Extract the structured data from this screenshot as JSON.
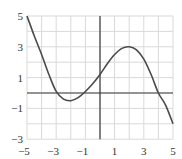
{
  "chart_data": {
    "type": "line",
    "title": "",
    "xlabel": "",
    "ylabel": "",
    "xlim": [
      -5,
      5
    ],
    "ylim": [
      -3,
      5
    ],
    "grid": true,
    "x_ticks": [
      -5,
      -3,
      -1,
      1,
      3,
      5
    ],
    "y_ticks": [
      5,
      3,
      1,
      -1,
      -3
    ],
    "x_tick_labels": [
      "−5",
      "−3",
      "−1",
      "1",
      "3",
      "5"
    ],
    "y_tick_labels": [
      "5",
      "3",
      "1",
      "−1",
      "−3"
    ],
    "series": [
      {
        "name": "f(x)",
        "x": [
          -5,
          -4.5,
          -4,
          -3.5,
          -3,
          -2.5,
          -2,
          -1.5,
          -1,
          -0.5,
          0,
          0.5,
          1,
          1.5,
          2,
          2.5,
          3,
          3.5,
          4,
          4.5,
          5
        ],
        "y": [
          5,
          3.7,
          2.5,
          1.2,
          0.1,
          -0.4,
          -0.5,
          -0.3,
          0.1,
          0.6,
          1.2,
          1.9,
          2.5,
          2.9,
          3.0,
          2.8,
          2.2,
          1.2,
          0.0,
          -0.8,
          -2.0
        ]
      }
    ]
  }
}
